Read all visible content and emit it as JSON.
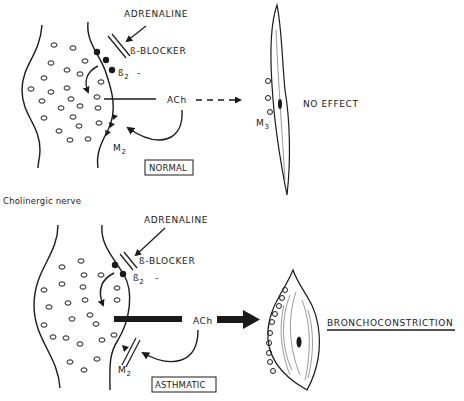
{
  "figure": {
    "section_label": "Cholinergic nerve",
    "panels": [
      {
        "id": "normal",
        "state_label": "NORMAL",
        "adrenaline_label": "ADRENALINE",
        "blocker_label": "ß-BLOCKER",
        "beta_receptor_label": "ß",
        "beta_receptor_sub": "2",
        "beta_sign": "-",
        "neurotransmitter_label": "ACh",
        "autoreceptor_label": "M",
        "autoreceptor_sub": "2",
        "muscle_receptor_label": "M",
        "muscle_receptor_sub": "3",
        "outcome_label": "NO EFFECT"
      },
      {
        "id": "asthmatic",
        "state_label": "ASTHMATIC",
        "adrenaline_label": "ADRENALINE",
        "blocker_label": "ß-BLOCKER",
        "beta_receptor_label": "ß",
        "beta_receptor_sub": "2",
        "beta_sign": "-",
        "neurotransmitter_label": "ACh",
        "autoreceptor_label": "M",
        "autoreceptor_sub": "2",
        "outcome_label": "BRONCHOCONSTRICTION"
      }
    ]
  }
}
